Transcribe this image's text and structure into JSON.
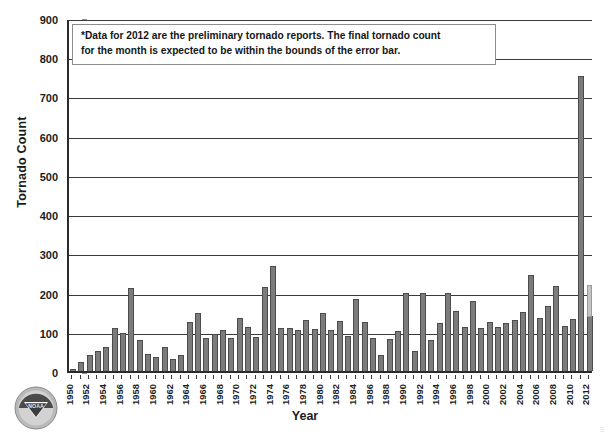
{
  "chart_data": {
    "type": "bar",
    "title": "",
    "xlabel": "Year",
    "ylabel": "Tornado Count",
    "ylim": [
      0,
      900
    ],
    "ytick_step": 100,
    "yticks": [
      0,
      100,
      200,
      300,
      400,
      500,
      600,
      700,
      800,
      900
    ],
    "grid": "horizontal",
    "legend": "none",
    "bar_color": "#7c7c7c",
    "bar_edge_color": "#4c4c4c",
    "errorbar_color": "#c4c4c4",
    "annotation": "*Data for 2012 are the preliminary tornado reports. The final tornado count for the month is expected to be within the bounds of the error bar.",
    "annotation_lines": [
      "*Data for 2012 are the preliminary tornado reports. The final tornado count",
      "for the month is expected to be within the bounds of the error bar."
    ],
    "xtick_labels": [
      "1950",
      "1952",
      "1954",
      "1956",
      "1958",
      "1960",
      "1962",
      "1964",
      "1966",
      "1968",
      "1970",
      "1972",
      "1974",
      "1976",
      "1978",
      "1980",
      "1982",
      "1984",
      "1986",
      "1988",
      "1990",
      "1992",
      "1994",
      "1996",
      "1998",
      "2000",
      "2002",
      "2004",
      "2006",
      "2008",
      "2010",
      "2012"
    ],
    "categories": [
      1950,
      1951,
      1952,
      1953,
      1954,
      1955,
      1956,
      1957,
      1958,
      1959,
      1960,
      1961,
      1962,
      1963,
      1964,
      1965,
      1966,
      1967,
      1968,
      1969,
      1970,
      1971,
      1972,
      1973,
      1974,
      1975,
      1976,
      1977,
      1978,
      1979,
      1980,
      1981,
      1982,
      1983,
      1984,
      1985,
      1986,
      1987,
      1988,
      1989,
      1990,
      1991,
      1992,
      1993,
      1994,
      1995,
      1996,
      1997,
      1998,
      1999,
      2000,
      2001,
      2002,
      2003,
      2004,
      2005,
      2006,
      2007,
      2008,
      2009,
      2010,
      2011,
      2012
    ],
    "values": [
      4,
      22,
      40,
      52,
      62,
      110,
      97,
      211,
      78,
      44,
      36,
      60,
      30,
      42,
      126,
      148,
      85,
      95,
      105,
      85,
      136,
      112,
      86,
      215,
      267,
      110,
      109,
      105,
      130,
      108,
      147,
      105,
      127,
      90,
      184,
      124,
      83,
      41,
      82,
      101,
      200,
      50,
      199,
      80,
      123,
      199,
      153,
      113,
      178,
      110,
      124,
      113,
      122,
      130,
      151,
      246,
      136,
      167,
      217,
      115,
      132,
      753,
      140
    ],
    "errorbar": {
      "year": 2012,
      "value": 140,
      "upper": 220,
      "lower": 138
    },
    "max_value": 753,
    "max_year": 2011
  },
  "logo": {
    "name": "noaa-logo",
    "alt": "NOAA"
  }
}
